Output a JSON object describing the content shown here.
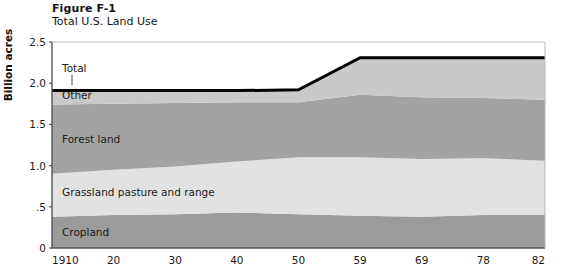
{
  "figure": {
    "number": "Figure F-1",
    "title": "Total U.S. Land Use",
    "y_axis_title": "Billion acres"
  },
  "colors": {
    "other": "#c9c9c9",
    "forest": "#a3a3a3",
    "grassland": "#e2e2e2",
    "cropland": "#9b9b9b",
    "total_line": "#000000",
    "axis": "#555555",
    "text": "#1a1a1a",
    "background": "#ffffff"
  },
  "chart_data": {
    "type": "area",
    "title": "Total U.S. Land Use",
    "subtitle": "Figure F-1",
    "xlabel": "",
    "ylabel": "Billion acres",
    "stacked": true,
    "grid": false,
    "legend_position": "inline",
    "xlim": [
      1910,
      1982
    ],
    "ylim": [
      0,
      2.5
    ],
    "x": [
      1910,
      1920,
      1930,
      1940,
      1950,
      1959,
      1969,
      1978,
      1982
    ],
    "xtick_labels": [
      "1910",
      "20",
      "30",
      "40",
      "50",
      "59",
      "69",
      "78",
      "82"
    ],
    "ytick_labels": [
      "0",
      ".5",
      "1.0",
      "1.5",
      "2.0",
      "2.5"
    ],
    "ytick_values": [
      0,
      0.5,
      1.0,
      1.5,
      2.0,
      2.5
    ],
    "series": [
      {
        "name": "Cropland",
        "color": "#9b9b9b",
        "values": [
          0.38,
          0.4,
          0.41,
          0.43,
          0.41,
          0.39,
          0.38,
          0.4,
          0.4
        ]
      },
      {
        "name": "Grassland pasture and range",
        "color": "#e2e2e2",
        "values": [
          0.52,
          0.55,
          0.58,
          0.62,
          0.69,
          0.71,
          0.7,
          0.69,
          0.66
        ]
      },
      {
        "name": "Forest land",
        "color": "#a3a3a3",
        "values": [
          0.84,
          0.8,
          0.77,
          0.72,
          0.67,
          0.76,
          0.75,
          0.73,
          0.74
        ]
      },
      {
        "name": "Other",
        "color": "#c9c9c9",
        "values": [
          0.17,
          0.16,
          0.15,
          0.14,
          0.15,
          0.45,
          0.48,
          0.49,
          0.51
        ]
      }
    ],
    "total_line": {
      "name": "Total",
      "color": "#000000",
      "values": [
        1.91,
        1.91,
        1.91,
        1.91,
        1.92,
        2.31,
        2.31,
        2.31,
        2.31
      ]
    },
    "inline_labels": [
      {
        "text": "Total",
        "x": 62,
        "y": 72
      },
      {
        "text": "Other",
        "x": 62,
        "y": 99
      },
      {
        "text": "Forest land",
        "x": 62,
        "y": 143
      },
      {
        "text": "Grassland pasture and range",
        "x": 62,
        "y": 196
      },
      {
        "text": "Cropland",
        "x": 62,
        "y": 236
      }
    ]
  }
}
